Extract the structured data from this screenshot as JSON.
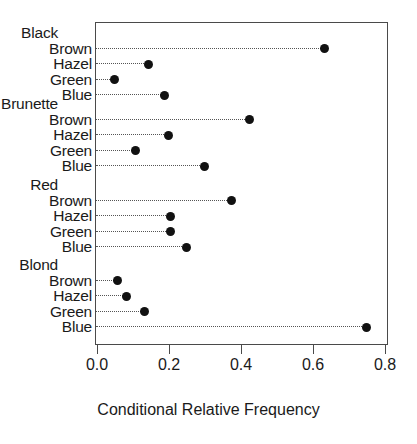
{
  "chart_data": {
    "type": "scatter",
    "subtype": "cleveland-dot-plot",
    "title": "",
    "xlabel": "Conditional Relative Frequency",
    "ylabel": "",
    "xlim": [
      0.0,
      0.8
    ],
    "xticks": [
      0.0,
      0.2,
      0.4,
      0.6,
      0.8
    ],
    "xticklabels": [
      "0.0",
      "0.2",
      "0.4",
      "0.6",
      "0.8"
    ],
    "grid": false,
    "legend": "none",
    "leader_lines": true,
    "marker": "filled-circle",
    "marker_color": "#111111",
    "group_label": "Hair Color",
    "category_label": "Eye Color",
    "groups": [
      {
        "name": "Black",
        "categories": [
          "Brown",
          "Hazel",
          "Green",
          "Blue"
        ],
        "values": [
          0.63,
          0.14,
          0.045,
          0.185
        ]
      },
      {
        "name": "Brunette",
        "categories": [
          "Brown",
          "Hazel",
          "Green",
          "Blue"
        ],
        "values": [
          0.42,
          0.195,
          0.105,
          0.295
        ]
      },
      {
        "name": "Red",
        "categories": [
          "Brown",
          "Hazel",
          "Green",
          "Blue"
        ],
        "values": [
          0.37,
          0.2,
          0.2,
          0.245
        ]
      },
      {
        "name": "Blond",
        "categories": [
          "Brown",
          "Hazel",
          "Green",
          "Blue"
        ],
        "values": [
          0.055,
          0.08,
          0.13,
          0.745
        ]
      }
    ]
  },
  "axis": {
    "title": "Conditional Relative Frequency"
  },
  "colors": {
    "marker": "#111111",
    "frame": "#4a4a4a",
    "leader": "#555555",
    "background": "#ffffff",
    "text": "#1a1a1a"
  }
}
